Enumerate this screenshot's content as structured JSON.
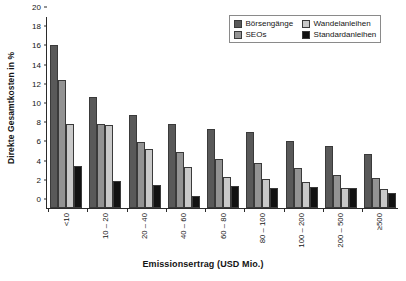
{
  "chart_data": {
    "type": "bar",
    "title": "",
    "subtitle": "",
    "xlabel": "Emissionsertrag (USD Mio.)",
    "ylabel": "Direkte Gesamtkosten in %",
    "ylim": [
      0,
      20
    ],
    "yticks": [
      0,
      2,
      4,
      6,
      8,
      10,
      12,
      14,
      16,
      18,
      20
    ],
    "ytick_labels": [
      "0",
      "2",
      "4",
      "6",
      "8",
      "10",
      "12",
      "14",
      "16",
      "18",
      "20"
    ],
    "grid": false,
    "legend_position": "top-right",
    "categories": [
      "<10",
      "10 – 20",
      "20 – 40",
      "40 – 60",
      "60 – 80",
      "80 – 100",
      "100 – 200",
      "200 – 500",
      "≥500"
    ],
    "series": [
      {
        "name": "Börsengänge",
        "color": "#595959",
        "values": [
          17.0,
          11.6,
          9.7,
          8.7,
          8.2,
          7.9,
          7.0,
          6.5,
          5.6
        ]
      },
      {
        "name": "SEOs",
        "color": "#939393",
        "values": [
          13.3,
          8.7,
          6.9,
          5.8,
          5.1,
          4.7,
          4.2,
          3.4,
          3.1
        ]
      },
      {
        "name": "Wandelanleihen",
        "color": "#c9c9c9",
        "values": [
          8.7,
          8.6,
          6.1,
          4.3,
          3.2,
          3.0,
          2.7,
          2.1,
          2.0
        ]
      },
      {
        "name": "Standardanleihen",
        "color": "#121212",
        "values": [
          4.4,
          2.8,
          2.4,
          1.3,
          2.3,
          2.1,
          2.2,
          2.1,
          1.6
        ]
      }
    ]
  }
}
